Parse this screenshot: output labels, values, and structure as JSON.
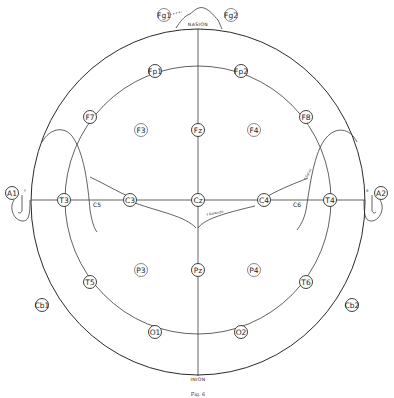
{
  "figure": {
    "caption": "Fig. 6",
    "landmarks": {
      "nasion": "NASION",
      "inion": "INION"
    },
    "annotations": {
      "c5": "C5",
      "c6": "C6",
      "fissure_label_center": "f Rolando",
      "fissure_label_right": "f Sylvii",
      "ear_mark_left": "F",
      "ear_mark_right": "B"
    },
    "colors": {
      "ink": "#2a2a2a",
      "paper": "#ffffff"
    }
  },
  "electrodes": {
    "fg1": {
      "label": "Fg1",
      "x": 164,
      "y": 15
    },
    "fg2": {
      "label": "Fg2",
      "x": 231,
      "y": 15
    },
    "fp1": {
      "label": "Fp1",
      "x": 155,
      "y": 71
    },
    "fp2": {
      "label": "Fp2",
      "x": 241,
      "y": 71
    },
    "f7": {
      "label": "F7",
      "x": 90,
      "y": 117
    },
    "f3": {
      "label": "F3",
      "x": 141,
      "y": 130
    },
    "fz": {
      "label": "Fz",
      "x": 198,
      "y": 130
    },
    "f4": {
      "label": "F4",
      "x": 254,
      "y": 130
    },
    "f8": {
      "label": "F8",
      "x": 306,
      "y": 117
    },
    "a1": {
      "label": "A1",
      "x": 12,
      "y": 193
    },
    "t3": {
      "label": "T3",
      "x": 64,
      "y": 200
    },
    "c3": {
      "label": "C3",
      "x": 130,
      "y": 200
    },
    "cz": {
      "label": "Cz",
      "x": 198,
      "y": 200
    },
    "c4": {
      "label": "C4",
      "x": 264,
      "y": 200
    },
    "t4": {
      "label": "T4",
      "x": 330,
      "y": 200
    },
    "a2": {
      "label": "A2",
      "x": 381,
      "y": 193
    },
    "t5": {
      "label": "T5",
      "x": 90,
      "y": 282
    },
    "p3": {
      "label": "P3",
      "x": 141,
      "y": 270
    },
    "pz": {
      "label": "Pz",
      "x": 198,
      "y": 270
    },
    "p4": {
      "label": "P4",
      "x": 254,
      "y": 270
    },
    "t6": {
      "label": "T6",
      "x": 306,
      "y": 282
    },
    "cb1": {
      "label": "Cb1",
      "x": 42,
      "y": 305
    },
    "cb2": {
      "label": "Cb2",
      "x": 352,
      "y": 305
    },
    "o1": {
      "label": "O1",
      "x": 155,
      "y": 332
    },
    "o2": {
      "label": "O2",
      "x": 241,
      "y": 332
    }
  }
}
